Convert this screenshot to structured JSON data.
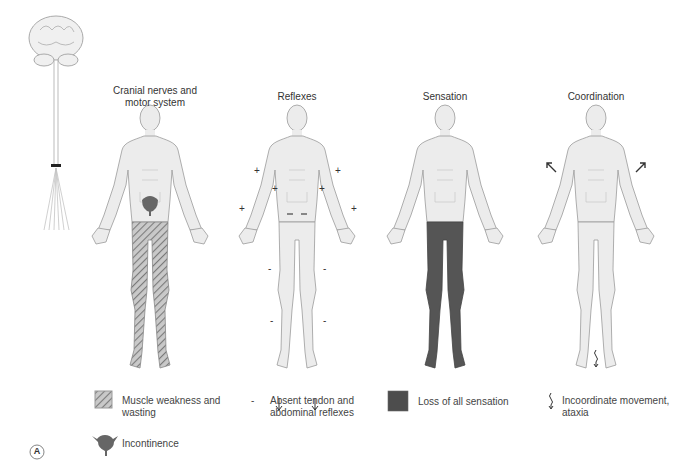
{
  "panels": [
    {
      "title_line1": "Cranial nerves and",
      "title_line2": "motor system",
      "legs": "hatched"
    },
    {
      "title_line1": "Reflexes",
      "legs": "normal"
    },
    {
      "title_line1": "Sensation",
      "legs": "dark"
    },
    {
      "title_line1": "Coordination",
      "legs": "normal"
    }
  ],
  "reflex_marks": {
    "plus": "+",
    "minus": "-"
  },
  "legend": {
    "muscle": {
      "icon": "hatched-square-icon",
      "line1": "Muscle weakness and",
      "line2": "wasting"
    },
    "reflex": {
      "icon": "minus-sign-icon",
      "symbol": "-",
      "line1": "Absent tendon and",
      "line2": "abdominal reflexes"
    },
    "sensation": {
      "icon": "dark-square-icon",
      "line1": "Loss of all sensation"
    },
    "coordination": {
      "icon": "squiggle-arrow-icon",
      "line1": "Incoordinate movement,",
      "line2": "ataxia"
    },
    "incontinence": {
      "icon": "bladder-icon",
      "line1": "Incontinence"
    }
  },
  "figure_label": "A",
  "colors": {
    "body_fill": "#ececec",
    "body_stroke": "#9a9a9a",
    "dark_fill": "#555555",
    "hatch": "#8a8a8a",
    "bladder": "#666666"
  }
}
